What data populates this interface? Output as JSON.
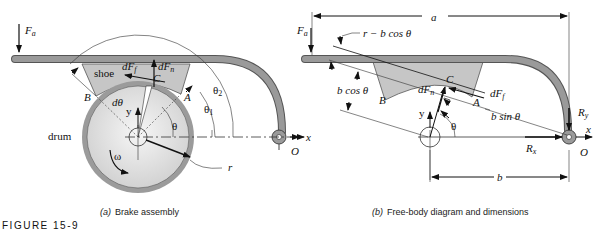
{
  "figure": {
    "number_label": "FIGURE 15-9",
    "panel_a": {
      "caption_letter": "(a)",
      "caption_text": "Brake assembly",
      "labels": {
        "Fa": "F",
        "Fa_sub": "a",
        "shoe": "shoe",
        "dFf": "dF",
        "dFf_sub": "f",
        "dFn": "dF",
        "dFn_sub": "n",
        "C": "C",
        "B": "B",
        "A": "A",
        "dtheta": "dθ",
        "y": "y",
        "theta": "θ",
        "theta1": "θ",
        "theta1_sub": "1",
        "theta2": "θ",
        "theta2_sub": "2",
        "drum": "drum",
        "omega": "ω",
        "r": "r",
        "O": "O",
        "x": "x"
      }
    },
    "panel_b": {
      "caption_letter": "(b)",
      "caption_text": "Free-body diagram and dimensions",
      "labels": {
        "a": "a",
        "Fa": "F",
        "Fa_sub": "a",
        "r_minus_bcos": "r − b cos θ",
        "bcos": "b cos θ",
        "C": "C",
        "dFn": "dF",
        "dFn_sub": "n",
        "dFf": "dF",
        "dFf_sub": "f",
        "B": "B",
        "A": "A",
        "bsin": "b sin θ",
        "y": "y",
        "theta": "θ",
        "Ry": "R",
        "Ry_sub": "y",
        "Rx": "R",
        "Rx_sub": "x",
        "O": "O",
        "x": "x",
        "b": "b"
      }
    }
  }
}
